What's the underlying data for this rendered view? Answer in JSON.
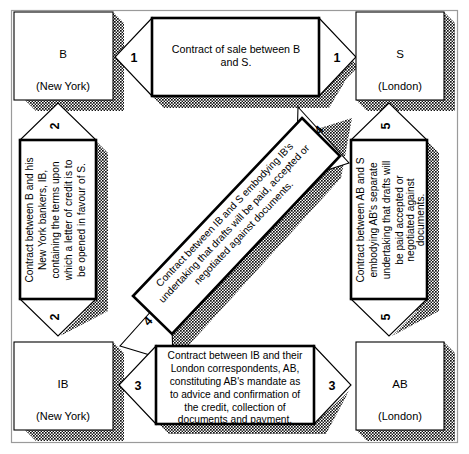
{
  "diagram": {
    "colors": {
      "ink": "#000000",
      "paper": "#ffffff",
      "shadow": "#1a1a1a",
      "frame": "#9a9a9a"
    },
    "nodes": [
      {
        "id": "B",
        "label": "B",
        "location": "(New York)"
      },
      {
        "id": "S",
        "label": "S",
        "location": "(London)"
      },
      {
        "id": "IB",
        "label": "IB",
        "location": "(New York)"
      },
      {
        "id": "AB",
        "label": "AB",
        "location": "(London)"
      }
    ],
    "arrows": [
      {
        "id": "arrow-1",
        "number": "1",
        "number_start": "1",
        "number_end": "1",
        "orientation": "horizontal",
        "direction": "double",
        "from": "B",
        "to": "S",
        "lines": [
          "Contract of sale between B",
          "and S."
        ]
      },
      {
        "id": "arrow-2",
        "number": "2",
        "number_start": "2",
        "number_end": "2",
        "orientation": "vertical",
        "direction": "double",
        "from": "B",
        "to": "IB",
        "lines": [
          "Contract between B and his",
          "New York bankers, IB,",
          "containing the terms upon",
          "which a letter of credit is to",
          "be opened in favour of S."
        ]
      },
      {
        "id": "arrow-3",
        "number": "3",
        "number_start": "3",
        "number_end": "3",
        "orientation": "horizontal",
        "direction": "double",
        "from": "IB",
        "to": "AB",
        "lines": [
          "Contract between IB and their",
          "London correspondents, AB,",
          "constituting AB's mandate as",
          "to advice and confirmation of",
          "the credit, collection of",
          "documents and payment."
        ]
      },
      {
        "id": "arrow-4",
        "number": "4",
        "number_start": "4",
        "number_end": "4",
        "orientation": "diagonal",
        "direction": "double",
        "from": "IB",
        "to": "S",
        "lines": [
          "Contract between IB and S embodying IB's",
          "undertaking that drafts will be paid, accepted or",
          "negotiated against documents."
        ]
      },
      {
        "id": "arrow-5",
        "number": "5",
        "number_start": "5",
        "number_end": "5",
        "orientation": "vertical",
        "direction": "double",
        "from": "S",
        "to": "AB",
        "lines": [
          "Contract between AB and S",
          "embodying AB's separate",
          "undertaking that drafts will",
          "be paid accepted or",
          "negotiated against",
          "documents."
        ]
      }
    ]
  }
}
